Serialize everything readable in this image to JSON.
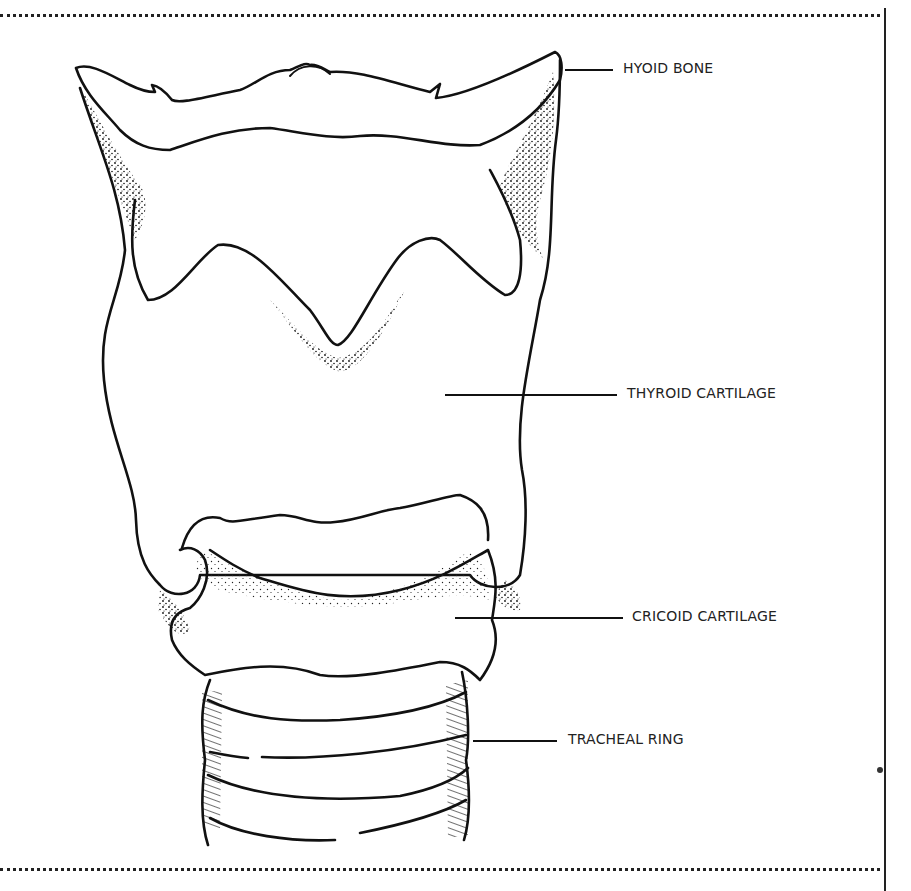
{
  "figure": {
    "labels": [
      {
        "id": "hyoid",
        "text": "HYOID BONE"
      },
      {
        "id": "thyroid",
        "text": "THYROID CARTILAGE"
      },
      {
        "id": "cricoid",
        "text": "CRICOID CARTILAGE"
      },
      {
        "id": "tracheal",
        "text": "TRACHEAL RING"
      }
    ]
  },
  "colors": {
    "ink": "#111111",
    "text": "#222222",
    "background": "#ffffff"
  }
}
